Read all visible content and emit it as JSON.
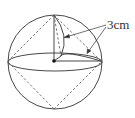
{
  "diagram": {
    "type": "sphere-with-inscribed-octahedron",
    "label_radius": "3cm",
    "colors": {
      "stroke": "#333333",
      "background": "#ffffff"
    }
  }
}
